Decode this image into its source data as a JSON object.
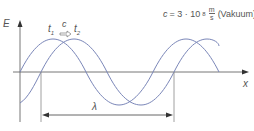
{
  "formula": {
    "lhs": "c",
    "eq": "= 3 · 10",
    "exp": "8",
    "frac_num": "m",
    "frac_den": "s",
    "note": "(Vakuum)"
  },
  "axes": {
    "y_label": "E",
    "x_label": "x"
  },
  "labels": {
    "t1": "t",
    "t1_sub": "1",
    "c": "c",
    "t2": "t",
    "t2_sub": "2",
    "lambda": "λ"
  },
  "colors": {
    "wave": "#7a86b8",
    "axis": "#555555",
    "arrow": "#333333"
  }
}
